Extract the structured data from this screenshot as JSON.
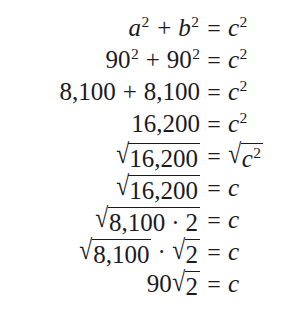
{
  "document": {
    "kind": "math-derivation",
    "title": "Pythagorean theorem derivation",
    "background_color": "#ffffff",
    "text_color": "#1b1b1f",
    "relation": "=",
    "plus": "+",
    "dot": "·",
    "surd": "√",
    "lines": [
      {
        "id": "line-1",
        "lhs_text": "a² + b²",
        "rhs_text": "c²",
        "lhs": {
          "a_base": "a",
          "a_exp": "2",
          "op": "+",
          "b_base": "b",
          "b_exp": "2"
        },
        "rhs": {
          "base": "c",
          "exp": "2"
        }
      },
      {
        "id": "line-2",
        "lhs_text": "90² + 90²",
        "rhs_text": "c²",
        "lhs": {
          "a_base": "90",
          "a_exp": "2",
          "op": "+",
          "b_base": "90",
          "b_exp": "2"
        },
        "rhs": {
          "base": "c",
          "exp": "2"
        }
      },
      {
        "id": "line-3",
        "lhs_text": "8,100 + 8,100",
        "rhs_text": "c²",
        "lhs": {
          "a_base": "8,100",
          "op": "+",
          "b_base": "8,100"
        },
        "rhs": {
          "base": "c",
          "exp": "2"
        }
      },
      {
        "id": "line-4",
        "lhs_text": "16,200",
        "rhs_text": "c²",
        "lhs": {
          "a_base": "16,200"
        },
        "rhs": {
          "base": "c",
          "exp": "2"
        }
      },
      {
        "id": "line-5",
        "lhs_text": "√16,200",
        "rhs_text": "√c²",
        "lhs": {
          "radicand": "16,200"
        },
        "rhs": {
          "radicand_base": "c",
          "radicand_exp": "2"
        }
      },
      {
        "id": "line-6",
        "lhs_text": "√16,200",
        "rhs_text": "c",
        "lhs": {
          "radicand": "16,200"
        },
        "rhs": {
          "base": "c"
        }
      },
      {
        "id": "line-7",
        "lhs_text": "√(8,100 · 2)",
        "rhs_text": "c",
        "lhs": {
          "radicand_a": "8,100",
          "op": "·",
          "radicand_b": "2"
        },
        "rhs": {
          "base": "c"
        }
      },
      {
        "id": "line-8",
        "lhs_text": "√8,100 · √2",
        "rhs_text": "c",
        "lhs": {
          "radicand_a": "8,100",
          "op": "·",
          "radicand_b": "2"
        },
        "rhs": {
          "base": "c"
        }
      },
      {
        "id": "line-9",
        "lhs_text": "90√2",
        "rhs_text": "c",
        "lhs": {
          "coefficient": "90",
          "radicand": "2"
        },
        "rhs": {
          "base": "c"
        }
      }
    ]
  }
}
